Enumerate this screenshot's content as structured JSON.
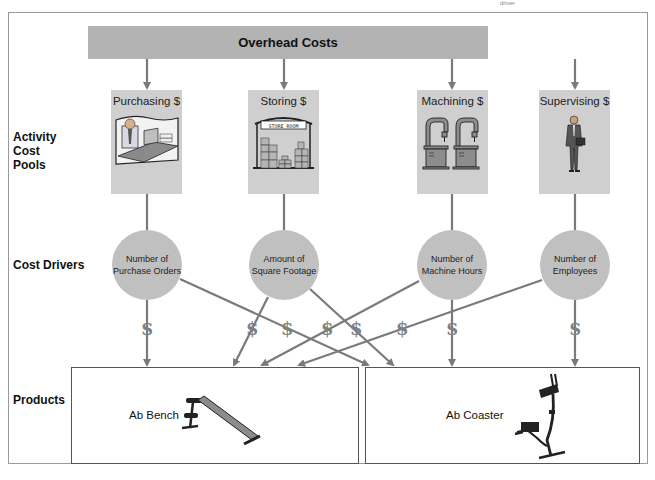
{
  "corner_note": "driver",
  "overhead": {
    "label": "Overhead Costs"
  },
  "row_labels": {
    "activity_cost_pools": [
      "Activity",
      "Cost",
      "Pools"
    ],
    "cost_drivers": "Cost Drivers",
    "products": "Products"
  },
  "activity_cost_pools": [
    {
      "label": "Purchasing $",
      "illustration": "office-worker-at-desk"
    },
    {
      "label": "Storing $",
      "illustration": "store-room",
      "sign": "STORE ROOM"
    },
    {
      "label": "Machining $",
      "illustration": "drill-press-machines"
    },
    {
      "label": "Supervising $",
      "illustration": "businessman-with-briefcase"
    }
  ],
  "cost_drivers": [
    {
      "line1": "Number of",
      "line2": "Purchase Orders"
    },
    {
      "line1": "Amount of",
      "line2": "Square Footage"
    },
    {
      "line1": "Number of",
      "line2": "Machine Hours"
    },
    {
      "line1": "Number of",
      "line2": "Employees"
    }
  ],
  "dollar_symbol": "$",
  "products": [
    {
      "label": "Ab Bench",
      "illustration": "ab-bench"
    },
    {
      "label": "Ab Coaster",
      "illustration": "ab-coaster"
    }
  ],
  "colors": {
    "overhead_bar": "#b3b3b3",
    "pool_box": "#cfcfcf",
    "driver_circle": "#c0c0c0",
    "connector": "#7a7a7a"
  }
}
